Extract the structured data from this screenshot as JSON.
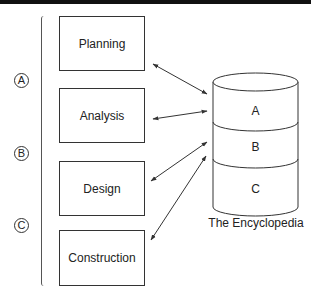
{
  "diagram": {
    "phases": [
      {
        "label": "Planning"
      },
      {
        "label": "Analysis"
      },
      {
        "label": "Design"
      },
      {
        "label": "Construction"
      }
    ],
    "markers": [
      {
        "label": "A"
      },
      {
        "label": "B"
      },
      {
        "label": "C"
      }
    ],
    "database": {
      "segments": [
        "A",
        "B",
        "C"
      ],
      "caption": "The Encyclopedia"
    },
    "connections": [
      {
        "from": "Planning",
        "to": "Encyclopedia",
        "direction": "bidirectional"
      },
      {
        "from": "Analysis",
        "to": "Encyclopedia",
        "direction": "bidirectional"
      },
      {
        "from": "Design",
        "to": "Encyclopedia",
        "direction": "bidirectional"
      },
      {
        "from": "Construction",
        "to": "Encyclopedia",
        "direction": "bidirectional"
      }
    ]
  }
}
